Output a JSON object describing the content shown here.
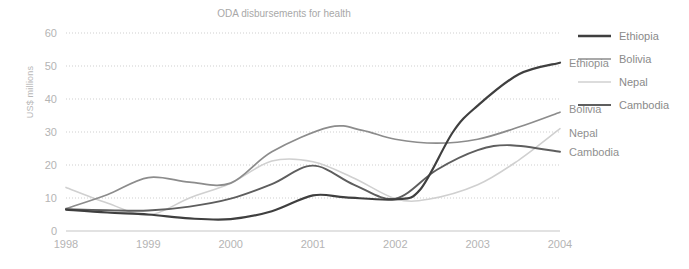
{
  "chart_data": {
    "type": "line",
    "title": "ODA disbursements for health",
    "xlabel": "",
    "ylabel": "US$ millions",
    "x": [
      1998,
      1999,
      2000,
      2001,
      2002,
      2003,
      2004
    ],
    "xtick_labels": [
      "1998",
      "1999",
      "2000",
      "2001",
      "2002",
      "2003",
      "2004"
    ],
    "ytick_labels": [
      "0",
      "10",
      "20",
      "30",
      "40",
      "50",
      "60"
    ],
    "yticks": [
      0,
      10,
      20,
      30,
      40,
      50,
      60
    ],
    "ylim": [
      0,
      60
    ],
    "xlim": [
      1998,
      2004
    ],
    "grid": "horizontal-dotted",
    "legend_position": "right",
    "series": [
      {
        "name": "Ethiopia",
        "color": "#3f3f3f",
        "width": 2.2,
        "end_label": "Ethiopia",
        "values": [
          6.5,
          5.0,
          3.6,
          10.8,
          9.6,
          38.0,
          51.0
        ],
        "points": [
          [
            1998.0,
            6.5
          ],
          [
            1998.5,
            5.6
          ],
          [
            1999.0,
            5.0
          ],
          [
            1999.5,
            3.8
          ],
          [
            2000.0,
            3.6
          ],
          [
            2000.5,
            6.0
          ],
          [
            2001.0,
            10.8
          ],
          [
            2001.4,
            10.2
          ],
          [
            2002.0,
            9.6
          ],
          [
            2002.3,
            12.5
          ],
          [
            2002.7,
            30.0
          ],
          [
            2003.0,
            38.0
          ],
          [
            2003.5,
            47.5
          ],
          [
            2004.0,
            51.0
          ]
        ]
      },
      {
        "name": "Bolivia",
        "color": "#8c8c8c",
        "width": 1.7,
        "end_label": "Bolivia",
        "values": [
          6.8,
          16.2,
          14.5,
          31.5,
          27.5,
          28.0,
          36.0
        ],
        "points": [
          [
            1998.0,
            6.8
          ],
          [
            1998.5,
            11.0
          ],
          [
            1999.0,
            16.2
          ],
          [
            1999.5,
            14.8
          ],
          [
            2000.0,
            14.5
          ],
          [
            2000.5,
            24.0
          ],
          [
            2001.2,
            31.5
          ],
          [
            2001.6,
            30.5
          ],
          [
            2002.0,
            27.8
          ],
          [
            2002.5,
            26.6
          ],
          [
            2003.0,
            27.8
          ],
          [
            2003.5,
            31.5
          ],
          [
            2004.0,
            36.0
          ]
        ]
      },
      {
        "name": "Nepal",
        "color": "#d0d0d0",
        "width": 1.6,
        "end_label": "Nepal",
        "values": [
          13.2,
          4.8,
          14.5,
          21.0,
          9.8,
          14.0,
          31.0
        ],
        "points": [
          [
            1998.0,
            13.2
          ],
          [
            1998.5,
            8.5
          ],
          [
            1999.0,
            4.8
          ],
          [
            1999.5,
            10.0
          ],
          [
            2000.0,
            14.5
          ],
          [
            2000.5,
            21.2
          ],
          [
            2001.0,
            21.0
          ],
          [
            2001.5,
            16.0
          ],
          [
            2002.0,
            9.8
          ],
          [
            2002.4,
            9.6
          ],
          [
            2003.0,
            14.0
          ],
          [
            2003.5,
            21.5
          ],
          [
            2004.0,
            31.0
          ]
        ]
      },
      {
        "name": "Cambodia",
        "color": "#5e5e5e",
        "width": 1.9,
        "end_label": "Cambodia",
        "values": [
          6.6,
          6.2,
          9.8,
          19.8,
          9.8,
          25.5,
          24.0
        ],
        "points": [
          [
            1998.0,
            6.6
          ],
          [
            1998.5,
            6.3
          ],
          [
            1999.0,
            6.2
          ],
          [
            1999.5,
            7.4
          ],
          [
            2000.0,
            9.8
          ],
          [
            2000.5,
            14.2
          ],
          [
            2001.0,
            19.8
          ],
          [
            2001.5,
            14.0
          ],
          [
            2002.0,
            9.8
          ],
          [
            2002.5,
            18.5
          ],
          [
            2003.0,
            24.5
          ],
          [
            2003.4,
            26.0
          ],
          [
            2004.0,
            24.0
          ]
        ]
      }
    ]
  },
  "legend": {
    "items": [
      {
        "label": "Ethiopia",
        "color": "#3f3f3f",
        "width": 2.4
      },
      {
        "label": "Bolivia",
        "color": "#8c8c8c",
        "width": 1.7
      },
      {
        "label": "Nepal",
        "color": "#d0d0d0",
        "width": 1.6
      },
      {
        "label": "Cambodia",
        "color": "#5e5e5e",
        "width": 2.0
      }
    ]
  },
  "end_labels": [
    {
      "label": "Ethiopia",
      "value": 51.0,
      "offset_y": 0
    },
    {
      "label": "Bolivia",
      "value": 36.0,
      "offset_y": -3
    },
    {
      "label": "Nepal",
      "value": 31.0,
      "offset_y": 4
    },
    {
      "label": "Cambodia",
      "value": 24.0,
      "offset_y": 0
    }
  ],
  "colors": {
    "background": "#ffffff",
    "grid": "#cfcfcf",
    "baseline": "#d8d8d8",
    "tick_text": "#b4b4b4",
    "title_text": "#a8a8a8",
    "label_text": "#8f8f8f"
  }
}
